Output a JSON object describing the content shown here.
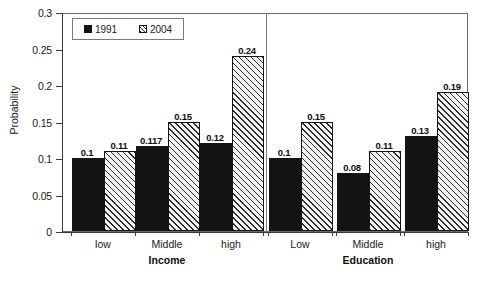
{
  "chart_data": {
    "type": "bar",
    "title": "",
    "subtitle": "",
    "xlabel": "",
    "ylabel": "Probability",
    "ylim": [
      0,
      0.3
    ],
    "ytick_labels": [
      "0",
      "0.05",
      "0.1",
      "0.15",
      "0.2",
      "0.25",
      "0.3"
    ],
    "ytick_values": [
      0,
      0.05,
      0.1,
      0.15,
      0.2,
      0.25,
      0.3
    ],
    "grid": false,
    "legend_position": "top-left",
    "groups": [
      {
        "name": "Income",
        "categories": [
          "low",
          "Middle",
          "high"
        ]
      },
      {
        "name": "Education",
        "categories": [
          "Low",
          "Middle",
          "high"
        ]
      }
    ],
    "categories": [
      "low",
      "Middle",
      "high",
      "Low",
      "Middle",
      "high"
    ],
    "series": [
      {
        "name": "1991",
        "fill": "solid-black",
        "values": [
          0.1,
          0.117,
          0.12,
          0.1,
          0.08,
          0.13
        ],
        "value_labels": [
          "0.1",
          "0.117",
          "0.12",
          "0.1",
          "0.08",
          "0.13"
        ]
      },
      {
        "name": "2004",
        "fill": "diagonal-hatch",
        "values": [
          0.11,
          0.15,
          0.24,
          0.15,
          0.11,
          0.19
        ],
        "value_labels": [
          "0.11",
          "0.15",
          "0.24",
          "0.15",
          "0.11",
          "0.19"
        ]
      }
    ]
  },
  "legend": {
    "entries": [
      {
        "label": "1991",
        "swatch": "solid-black-square-icon"
      },
      {
        "label": "2004",
        "swatch": "hatched-square-icon"
      }
    ]
  },
  "colors": {
    "series_1991": "#141414",
    "series_2004_fill": "#f2f2f2",
    "series_2004_hatch": "#2b2b2b",
    "axis": "#3a3a3a",
    "frame": "#6b6b6b",
    "text": "#1a1a1a",
    "background": "#ffffff"
  }
}
